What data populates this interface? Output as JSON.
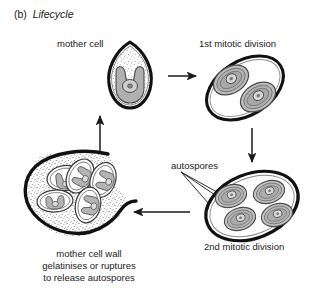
{
  "figure": {
    "panel_letter": "(b)",
    "panel_title": "Lifecycle",
    "background_color": "#ffffff",
    "ink_color": "#1a1a1a",
    "chloroplast_color": "#b0b0b0",
    "envelope_color": "#9a9a9a"
  },
  "labels": {
    "mother_cell": "mother cell",
    "first_division": "1st mitotic division",
    "second_division": "2nd mitotic division",
    "autospores": "autospores"
  },
  "caption": {
    "line1": "mother cell wall",
    "line2": "gelatinises or ruptures",
    "line3": "to release autospores"
  },
  "stages": [
    {
      "name": "mother-cell",
      "description": "teardrop cell with stippled cytoplasm and U-shaped chloroplast containing one pyrenoid",
      "spore_count": 1
    },
    {
      "name": "first-mitotic-division",
      "description": "tilted oval envelope containing two daughter protoplasts",
      "spore_count": 2
    },
    {
      "name": "second-mitotic-division",
      "description": "tilted oval envelope containing four autospores",
      "spore_count": 4
    },
    {
      "name": "released-autospores",
      "description": "ruptured gelatinised mother cell wall releasing four autospores",
      "spore_count": 4
    }
  ],
  "arrows": [
    {
      "name": "arrow-mother-to-first",
      "direction": "right"
    },
    {
      "name": "arrow-first-to-second",
      "direction": "down"
    },
    {
      "name": "arrow-second-to-release",
      "direction": "left"
    },
    {
      "name": "arrow-release-to-mother",
      "direction": "up"
    }
  ]
}
